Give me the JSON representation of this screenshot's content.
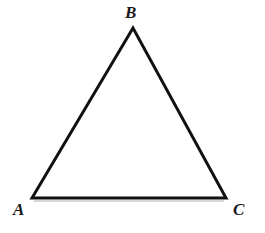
{
  "figure": {
    "kind": "geometry-diagram",
    "shape_name": "triangle",
    "width": 265,
    "height": 233,
    "background_color": "#ffffff",
    "stroke_color": "#111111",
    "stroke_width": 3,
    "fill_color": "none",
    "baseline_shadow_color": "#d8d8d8"
  },
  "vertices": [
    {
      "label": "A",
      "x": 32,
      "y": 198,
      "label_x": 13,
      "label_y": 201
    },
    {
      "label": "B",
      "x": 133,
      "y": 28,
      "label_x": 125,
      "label_y": 4
    },
    {
      "label": "C",
      "x": 226,
      "y": 198,
      "label_x": 233,
      "label_y": 201
    }
  ],
  "polygon_points": "32,198 133,28 226,198",
  "edges": [
    {
      "name": "AB",
      "from": "A",
      "to": "B"
    },
    {
      "name": "BC",
      "from": "B",
      "to": "C"
    },
    {
      "name": "CA",
      "from": "C",
      "to": "A"
    }
  ]
}
